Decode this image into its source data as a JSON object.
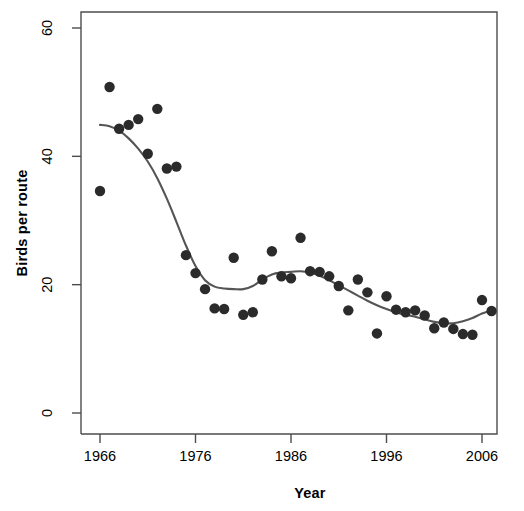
{
  "chart_data": {
    "type": "scatter",
    "title": "",
    "xlabel": "Year",
    "ylabel": "Birds per route",
    "xlim": [
      1965,
      2008
    ],
    "ylim": [
      0,
      62
    ],
    "xticks": [
      1966,
      1976,
      1986,
      1996,
      2006
    ],
    "yticks": [
      0,
      20,
      40,
      60
    ],
    "grid": false,
    "legend": null,
    "point_color": "#2b2b2b",
    "line_color": "#555555",
    "axis_color": "#4d4d4d",
    "series": [
      {
        "name": "Observed birds per route",
        "type": "scatter",
        "marker": "filled-circle",
        "x": [
          1966,
          1967,
          1968,
          1969,
          1970,
          1971,
          1972,
          1973,
          1974,
          1975,
          1976,
          1977,
          1978,
          1979,
          1980,
          1981,
          1982,
          1983,
          1984,
          1985,
          1986,
          1987,
          1988,
          1989,
          1990,
          1991,
          1992,
          1993,
          1994,
          1995,
          1996,
          1997,
          1998,
          1999,
          2000,
          2001,
          2002,
          2003,
          2004,
          2005,
          2006,
          2007
        ],
        "y": [
          34.6,
          50.8,
          44.3,
          44.9,
          45.8,
          40.4,
          47.4,
          38.1,
          38.4,
          24.6,
          21.8,
          19.3,
          16.3,
          16.2,
          24.2,
          15.3,
          15.7,
          20.8,
          25.2,
          21.3,
          21.0,
          27.3,
          22.1,
          22.0,
          21.3,
          19.8,
          16.0,
          20.8,
          18.8,
          12.4,
          18.2,
          16.1,
          15.7,
          16.0,
          15.2,
          13.2,
          14.1,
          13.1,
          12.3,
          12.2,
          17.6,
          15.9
        ]
      },
      {
        "name": "Smoothed trend",
        "type": "line",
        "x": [
          1966,
          1967,
          1968,
          1969,
          1970,
          1971,
          1972,
          1973,
          1974,
          1975,
          1976,
          1977,
          1978,
          1979,
          1980,
          1981,
          1982,
          1983,
          1984,
          1985,
          1986,
          1987,
          1988,
          1989,
          1990,
          1991,
          1992,
          1993,
          1994,
          1995,
          1996,
          1997,
          1998,
          1999,
          2000,
          2001,
          2002,
          2003,
          2004,
          2005,
          2006,
          2007
        ],
        "y": [
          44.9,
          44.7,
          44.0,
          42.8,
          41.2,
          39.2,
          36.6,
          33.4,
          29.8,
          26.1,
          22.9,
          20.7,
          19.7,
          19.4,
          19.3,
          19.3,
          19.8,
          20.8,
          21.6,
          21.9,
          22.0,
          22.1,
          21.9,
          21.4,
          20.7,
          19.9,
          19.1,
          18.3,
          17.5,
          16.8,
          16.2,
          15.7,
          15.3,
          15.0,
          14.6,
          14.2,
          14.0,
          14.0,
          14.3,
          14.8,
          15.5,
          16.0
        ]
      }
    ]
  },
  "axes": {
    "x_title": "Year",
    "y_title": "Birds per route",
    "x_tick_labels": [
      "1966",
      "1976",
      "1986",
      "1996",
      "2006"
    ],
    "y_tick_labels": [
      "0",
      "20",
      "40",
      "60"
    ]
  }
}
